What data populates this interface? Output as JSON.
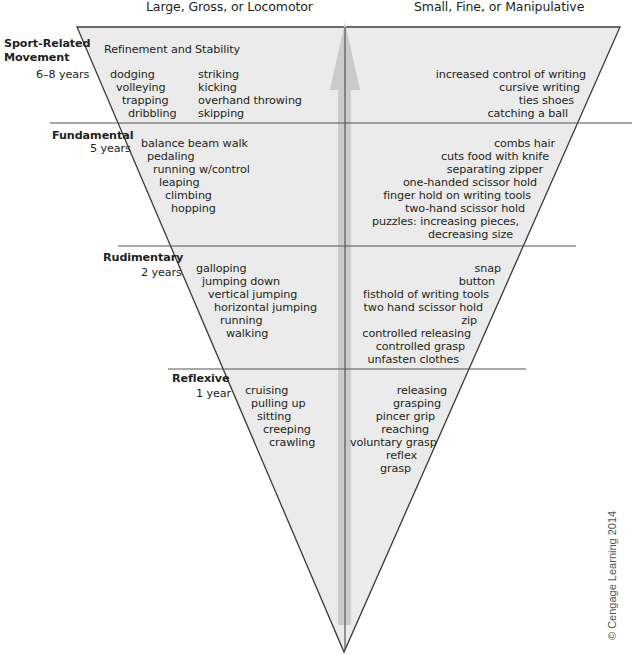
{
  "headers": {
    "left": "Large, Gross, or Locomotor",
    "right": "Small, Fine, or Manipulative"
  },
  "stages": [
    {
      "name_line1": "Sport-Related",
      "name_line2": "Movement",
      "age": "6–8 years",
      "subtitle": "Refinement and Stability",
      "gross_col1": [
        "dodging",
        "volleying",
        "trapping",
        "dribbling"
      ],
      "gross_col2": [
        "striking",
        "kicking",
        "overhand throwing",
        "skipping"
      ],
      "fine": [
        "increased control of writing",
        "cursive writing",
        "ties shoes",
        "catching a ball"
      ]
    },
    {
      "name": "Fundamental",
      "age": "5 years",
      "gross": [
        "balance beam walk",
        "pedaling",
        "running w/control",
        "leaping",
        "climbing",
        "hopping"
      ],
      "fine": [
        "combs hair",
        "cuts food with knife",
        "separating zipper",
        "one-handed scissor hold",
        "finger hold on writing tools",
        "two-hand scissor hold",
        "puzzles: increasing pieces,",
        "decreasing size"
      ]
    },
    {
      "name": "Rudimentary",
      "age": "2 years",
      "gross": [
        "galloping",
        "jumping down",
        "vertical jumping",
        "horizontal jumping",
        "running",
        "walking"
      ],
      "fine": [
        "snap",
        "button",
        "fisthold of writing tools",
        "two hand scissor hold",
        "zip",
        "controlled releasing",
        "controlled grasp",
        "unfasten clothes"
      ]
    },
    {
      "name": "Reflexive",
      "age": "1 year",
      "gross": [
        "cruising",
        "pulling up",
        "sitting",
        "creeping",
        "crawling"
      ],
      "fine": [
        "releasing",
        "grasping",
        "pincer grip",
        "reaching",
        "voluntary grasp",
        "reflex",
        "grasp"
      ]
    }
  ],
  "copyright": "© Cengage Learning 2014",
  "colors": {
    "triangle_fill": "#ebebeb",
    "outline": "#3a3a3a",
    "arrow": "#c8c8c8",
    "text": "#231f20"
  }
}
